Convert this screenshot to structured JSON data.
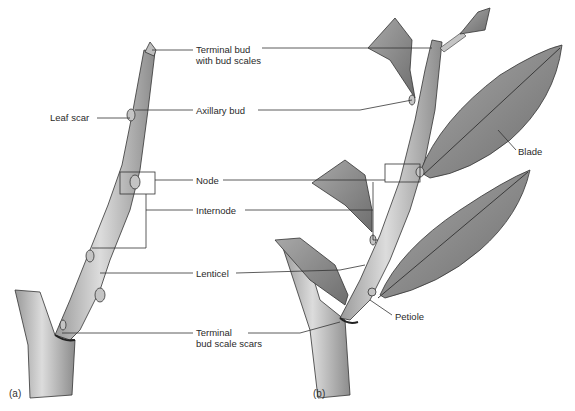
{
  "figure": {
    "panels": [
      {
        "id": "a",
        "label": "(a)"
      },
      {
        "id": "b",
        "label": "(b)"
      }
    ],
    "labels": {
      "terminal_bud_line1": "Terminal bud",
      "terminal_bud_line2": "with bud scales",
      "leaf_scar": "Leaf scar",
      "axillary_bud": "Axillary bud",
      "node": "Node",
      "internode": "Internode",
      "lenticel": "Lenticel",
      "terminal_bud_scale_scars_line1": "Terminal",
      "terminal_bud_scale_scars_line2": "bud scale scars",
      "blade": "Blade",
      "petiole": "Petiole"
    },
    "colors": {
      "line": "#333333",
      "bark": "#c8c8c8",
      "leaf": "#8a8a8a",
      "leaf_vein": "#3a3a3a",
      "text": "#2a2a2a"
    }
  }
}
